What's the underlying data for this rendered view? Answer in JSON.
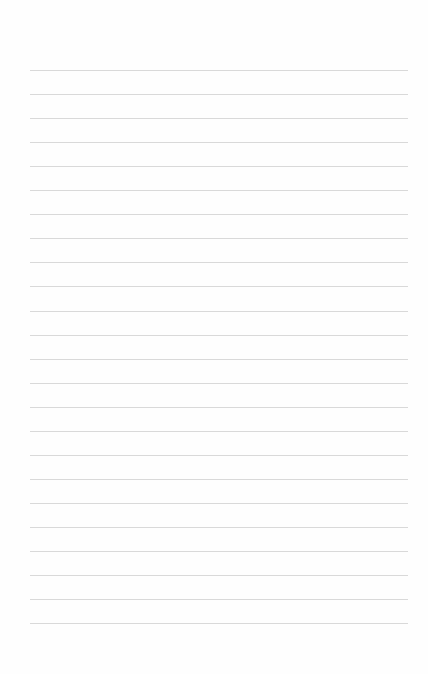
{
  "page": {
    "type": "ruled-notebook-page",
    "background_color": "#fefefe",
    "rule_color": "#d9d9d9",
    "rule_count": 24,
    "first_rule_y": 70,
    "rule_spacing": 24.05,
    "content": ""
  }
}
